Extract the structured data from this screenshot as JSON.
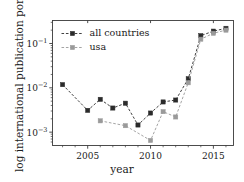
{
  "chart_data": {
    "type": "line",
    "title": "",
    "xlabel": "year",
    "ylabel": "log international publication portion",
    "yscale": "log",
    "xlim": [
      2002.2,
      2016.6
    ],
    "ylim": [
      0.0005,
      0.33
    ],
    "grid": false,
    "legend_position": "upper left",
    "yticks": [
      0.1,
      0.01,
      0.001
    ],
    "ytick_labels": [
      "10−1",
      "10−2",
      "10−3"
    ],
    "xticks": [
      2005,
      2010,
      2015
    ],
    "xtick_labels": [
      "2005",
      "2010",
      "2015"
    ],
    "series": [
      {
        "name": "all countries",
        "color": "#2b2b2b",
        "marker": "square",
        "linestyle": "dashed",
        "x": [
          2003,
          2005,
          2006,
          2007,
          2008,
          2009,
          2010,
          2011,
          2012,
          2013,
          2014,
          2015,
          2016
        ],
        "values": [
          0.0118,
          0.0031,
          0.0055,
          0.0035,
          0.0045,
          0.00145,
          0.0027,
          0.0048,
          0.0053,
          0.016,
          0.15,
          0.19,
          0.22
        ]
      },
      {
        "name": "usa",
        "color": "#9a9a9a",
        "marker": "square",
        "linestyle": "dashed",
        "x": [
          2006,
          2008,
          2010,
          2011,
          2012,
          2013,
          2014,
          2015,
          2016
        ],
        "values": [
          0.0018,
          0.0014,
          0.00065,
          0.0029,
          0.0022,
          0.013,
          0.125,
          0.17,
          0.2
        ]
      }
    ]
  },
  "legend": {
    "entries": [
      {
        "label": "all countries"
      },
      {
        "label": "usa"
      }
    ]
  },
  "axes": {
    "spine_color": "#3a3a3a"
  }
}
